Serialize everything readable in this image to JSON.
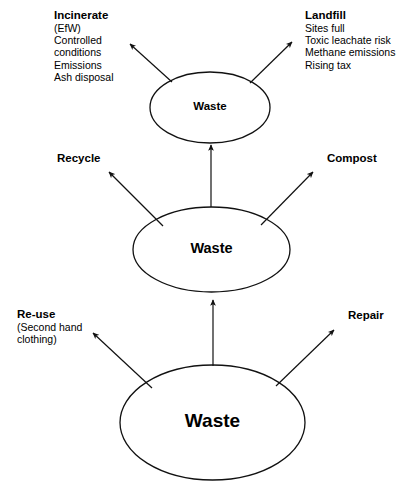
{
  "diagram": {
    "type": "concept-diagram",
    "background_color": "#ffffff",
    "stroke_color": "#000000",
    "text_color": "#000000",
    "nodes": [
      {
        "id": "waste-top",
        "label": "Waste",
        "level": "top"
      },
      {
        "id": "waste-middle",
        "label": "Waste",
        "level": "middle"
      },
      {
        "id": "waste-bottom",
        "label": "Waste",
        "level": "bottom"
      }
    ],
    "branches": [
      {
        "id": "incinerate",
        "heading": "Incinerate",
        "lines": [
          "(EfW)",
          "Controlled",
          "conditions",
          "Emissions",
          "Ash disposal"
        ],
        "from": "waste-top",
        "direction": "up-left"
      },
      {
        "id": "landfill",
        "heading": "Landfill",
        "lines": [
          "Sites full",
          "Toxic leachate risk",
          "Methane emissions",
          "Rising tax"
        ],
        "from": "waste-top",
        "direction": "up-right"
      },
      {
        "id": "recycle",
        "heading": "Recycle",
        "lines": [],
        "from": "waste-middle",
        "direction": "up-left"
      },
      {
        "id": "compost",
        "heading": "Compost",
        "lines": [],
        "from": "waste-middle",
        "direction": "up-right"
      },
      {
        "id": "reuse",
        "heading": "Re-use",
        "lines": [
          "(Second hand",
          "clothing)"
        ],
        "from": "waste-bottom",
        "direction": "up-left"
      },
      {
        "id": "repair",
        "heading": "Repair",
        "lines": [],
        "from": "waste-bottom",
        "direction": "up-right"
      }
    ],
    "connectors": [
      {
        "id": "bottom-to-middle",
        "from": "waste-bottom",
        "to": "waste-middle",
        "style": "vertical-arrow"
      },
      {
        "id": "middle-to-top",
        "from": "waste-middle",
        "to": "waste-top",
        "style": "vertical-arrow"
      }
    ]
  }
}
